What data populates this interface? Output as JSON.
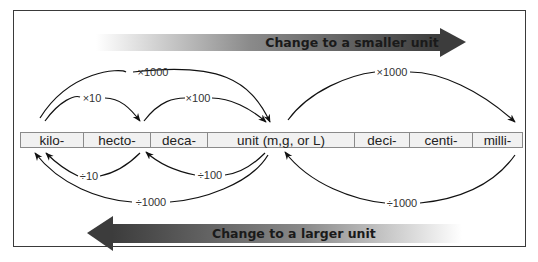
{
  "top_arrow": {
    "label": "Change to a smaller unit",
    "direction": "right"
  },
  "bottom_arrow": {
    "label": "Change to a larger unit",
    "direction": "left"
  },
  "units": [
    {
      "label": "kilo-"
    },
    {
      "label": "hecto-"
    },
    {
      "label": "deca-"
    },
    {
      "label": "unit (m,g, or L)"
    },
    {
      "label": "deci-"
    },
    {
      "label": "centi-"
    },
    {
      "label": "milli-"
    }
  ],
  "multiply_arcs": [
    {
      "label": "×1000",
      "from": "kilo-",
      "to": "unit (m,g, or L)"
    },
    {
      "label": "×10",
      "from": "kilo-",
      "to": "hecto-"
    },
    {
      "label": "×100",
      "from": "deca-",
      "to": "unit (m,g, or L)"
    },
    {
      "label": "×1000",
      "from": "unit (m,g, or L)",
      "to": "milli-"
    }
  ],
  "divide_arcs": [
    {
      "label": "÷10",
      "from": "hecto-",
      "to": "kilo-"
    },
    {
      "label": "÷100",
      "from": "unit (m,g, or L)",
      "to": "deca-"
    },
    {
      "label": "÷1000",
      "from": "unit (m,g, or L)",
      "to": "kilo-"
    },
    {
      "label": "÷1000",
      "from": "milli-",
      "to": "unit (m,g, or L)"
    }
  ],
  "colors": {
    "arrow_dark": "#3c3c3c",
    "frame": "#3a3a3a",
    "cell_bg": "#f1f1f1"
  }
}
